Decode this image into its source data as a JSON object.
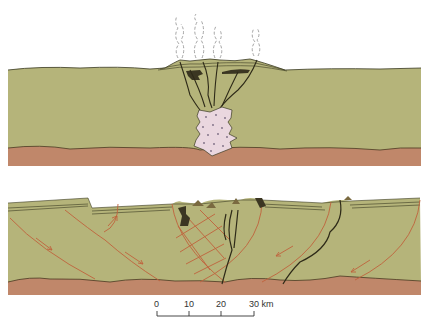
{
  "diagram": {
    "type": "geological-cross-section",
    "panels": [
      {
        "name": "upper-panel",
        "description": "Volcanic field over rising magma body with steam plumes",
        "features": [
          "steam-plumes",
          "volcanic-cones",
          "feeder-dikes",
          "lava-flows",
          "magma-chamber",
          "basement-layer"
        ]
      },
      {
        "name": "lower-panel",
        "description": "Rift basin with listric normal faults and central volcanic conduits",
        "features": [
          "listric-faults",
          "slip-arrows",
          "central-conduits",
          "sediment-cover",
          "basement-layer"
        ]
      }
    ],
    "colors": {
      "crust": "#b5b47a",
      "basement": "#c0876a",
      "magma": "#ead7df",
      "magma_dots": "#7a6a80",
      "fault_lines": "#c0623c",
      "dikes": "#2e2a18",
      "steam": "#9a9a9a"
    }
  },
  "scale_bar": {
    "ticks": [
      "0",
      "10",
      "20",
      "30"
    ],
    "unit": "km",
    "last_label": "30 km"
  }
}
